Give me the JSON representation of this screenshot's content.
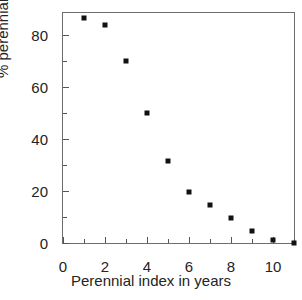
{
  "chart_data": {
    "type": "scatter",
    "title": "",
    "xlabel": "Perennial index in years",
    "ylabel": "% perennials",
    "xlim": [
      0,
      11
    ],
    "ylim": [
      0,
      88.5
    ],
    "grid": false,
    "legend": null,
    "marker": "filled-square",
    "marker_color": "#111111",
    "axis_color": "#6e6e6e",
    "xticks": [
      0,
      2,
      4,
      6,
      8,
      10
    ],
    "xtick_labels": [
      "0",
      "2",
      "4",
      "6",
      "8",
      "10"
    ],
    "xminor_ticks": [
      1,
      3,
      5,
      7,
      9,
      11
    ],
    "yticks": [
      0,
      20,
      40,
      60,
      80
    ],
    "ytick_labels": [
      "0",
      "20",
      "40",
      "60",
      "80"
    ],
    "yminor_ticks": [
      10,
      30,
      50,
      70
    ],
    "x": [
      1,
      2,
      3,
      4,
      5,
      6,
      7,
      8,
      9,
      10,
      11
    ],
    "values": [
      86.5,
      84,
      70,
      50,
      31.5,
      19.5,
      14.5,
      9.5,
      4.5,
      1,
      0
    ],
    "points": [
      {
        "x": 1,
        "y": 86.5
      },
      {
        "x": 2,
        "y": 84
      },
      {
        "x": 3,
        "y": 70
      },
      {
        "x": 4,
        "y": 50
      },
      {
        "x": 5,
        "y": 31.5
      },
      {
        "x": 6,
        "y": 19.5
      },
      {
        "x": 7,
        "y": 14.5
      },
      {
        "x": 8,
        "y": 9.5
      },
      {
        "x": 9,
        "y": 4.5
      },
      {
        "x": 10,
        "y": 1
      },
      {
        "x": 11,
        "y": 0
      }
    ]
  }
}
